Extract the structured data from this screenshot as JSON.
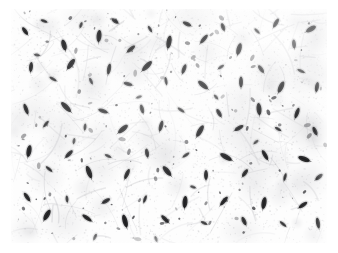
{
  "figure": {
    "kind": "histopathology-micrograph",
    "title": "",
    "caption": "",
    "scale_bar_label": "",
    "annotation_label": ""
  },
  "image": {
    "page_background": "#ffffff",
    "plate_left": 11,
    "plate_top": 9,
    "plate_width": 316,
    "plate_height": 234,
    "background_color": "#fdfdfd",
    "stroma_color": "#d8d8da",
    "stroma_color_dark": "#b4b4b8",
    "nucleus_color": "#1a1a1c",
    "nucleus_color_soft": "#4a4a4e",
    "staining": "hematoxylin-eosin-pale",
    "tissue_pattern": "wavy-collagen-fibers",
    "cell_shape": "spindle-nuclei"
  },
  "chart_data": {
    "type": "scatter",
    "title": "",
    "xlabel": "",
    "ylabel": "",
    "xlim": [
      0,
      316
    ],
    "ylim": [
      0,
      234
    ],
    "grid": false,
    "legend": "none",
    "note": "Positions, sizes and orientations of the dark spindle-shaped nuclei visible in the micrograph, in plate pixel coordinates.",
    "nuclei": [
      {
        "x": 14,
        "y": 22,
        "len": 9,
        "w": 4,
        "rot": 55,
        "shade": 0.86
      },
      {
        "x": 33,
        "y": 12,
        "len": 7,
        "w": 3,
        "rot": 20,
        "shade": 0.72
      },
      {
        "x": 53,
        "y": 36,
        "len": 11,
        "w": 5,
        "rot": 75,
        "shade": 0.92
      },
      {
        "x": 70,
        "y": 16,
        "len": 6,
        "w": 3,
        "rot": 110,
        "shade": 0.66
      },
      {
        "x": 88,
        "y": 27,
        "len": 12,
        "w": 5,
        "rot": 95,
        "shade": 0.9
      },
      {
        "x": 104,
        "y": 12,
        "len": 8,
        "w": 4,
        "rot": 35,
        "shade": 0.78
      },
      {
        "x": 120,
        "y": 40,
        "len": 10,
        "w": 4,
        "rot": 140,
        "shade": 0.84
      },
      {
        "x": 139,
        "y": 20,
        "len": 7,
        "w": 3,
        "rot": 60,
        "shade": 0.7
      },
      {
        "x": 158,
        "y": 33,
        "len": 13,
        "w": 5,
        "rot": 100,
        "shade": 0.93
      },
      {
        "x": 176,
        "y": 15,
        "len": 9,
        "w": 4,
        "rot": 25,
        "shade": 0.8
      },
      {
        "x": 193,
        "y": 30,
        "len": 11,
        "w": 4,
        "rot": 130,
        "shade": 0.88
      },
      {
        "x": 212,
        "y": 18,
        "len": 8,
        "w": 4,
        "rot": 70,
        "shade": 0.76
      },
      {
        "x": 228,
        "y": 40,
        "len": 12,
        "w": 5,
        "rot": 105,
        "shade": 0.91
      },
      {
        "x": 246,
        "y": 22,
        "len": 7,
        "w": 3,
        "rot": 45,
        "shade": 0.68
      },
      {
        "x": 265,
        "y": 14,
        "len": 10,
        "w": 4,
        "rot": 120,
        "shade": 0.86
      },
      {
        "x": 283,
        "y": 35,
        "len": 9,
        "w": 4,
        "rot": 85,
        "shade": 0.82
      },
      {
        "x": 300,
        "y": 20,
        "len": 11,
        "w": 5,
        "rot": 150,
        "shade": 0.89
      },
      {
        "x": 20,
        "y": 58,
        "len": 10,
        "w": 4,
        "rot": 95,
        "shade": 0.85
      },
      {
        "x": 42,
        "y": 70,
        "len": 8,
        "w": 3,
        "rot": 30,
        "shade": 0.74
      },
      {
        "x": 60,
        "y": 55,
        "len": 12,
        "w": 5,
        "rot": 125,
        "shade": 0.92
      },
      {
        "x": 80,
        "y": 72,
        "len": 7,
        "w": 3,
        "rot": 65,
        "shade": 0.7
      },
      {
        "x": 98,
        "y": 60,
        "len": 11,
        "w": 4,
        "rot": 100,
        "shade": 0.87
      },
      {
        "x": 117,
        "y": 75,
        "len": 9,
        "w": 4,
        "rot": 15,
        "shade": 0.79
      },
      {
        "x": 136,
        "y": 57,
        "len": 13,
        "w": 5,
        "rot": 135,
        "shade": 0.93
      },
      {
        "x": 155,
        "y": 72,
        "len": 8,
        "w": 3,
        "rot": 80,
        "shade": 0.75
      },
      {
        "x": 173,
        "y": 60,
        "len": 10,
        "w": 4,
        "rot": 110,
        "shade": 0.86
      },
      {
        "x": 192,
        "y": 76,
        "len": 12,
        "w": 5,
        "rot": 40,
        "shade": 0.9
      },
      {
        "x": 210,
        "y": 58,
        "len": 7,
        "w": 3,
        "rot": 145,
        "shade": 0.69
      },
      {
        "x": 230,
        "y": 73,
        "len": 11,
        "w": 4,
        "rot": 90,
        "shade": 0.88
      },
      {
        "x": 250,
        "y": 60,
        "len": 9,
        "w": 4,
        "rot": 55,
        "shade": 0.81
      },
      {
        "x": 270,
        "y": 78,
        "len": 12,
        "w": 5,
        "rot": 115,
        "shade": 0.91
      },
      {
        "x": 290,
        "y": 62,
        "len": 8,
        "w": 3,
        "rot": 25,
        "shade": 0.73
      },
      {
        "x": 306,
        "y": 78,
        "len": 10,
        "w": 4,
        "rot": 100,
        "shade": 0.85
      },
      {
        "x": 15,
        "y": 100,
        "len": 11,
        "w": 4,
        "rot": 70,
        "shade": 0.88
      },
      {
        "x": 35,
        "y": 115,
        "len": 8,
        "w": 3,
        "rot": 130,
        "shade": 0.75
      },
      {
        "x": 55,
        "y": 98,
        "len": 13,
        "w": 5,
        "rot": 45,
        "shade": 0.93
      },
      {
        "x": 74,
        "y": 118,
        "len": 7,
        "w": 3,
        "rot": 95,
        "shade": 0.68
      },
      {
        "x": 92,
        "y": 102,
        "len": 10,
        "w": 4,
        "rot": 20,
        "shade": 0.84
      },
      {
        "x": 112,
        "y": 120,
        "len": 12,
        "w": 5,
        "rot": 140,
        "shade": 0.9
      },
      {
        "x": 131,
        "y": 100,
        "len": 9,
        "w": 4,
        "rot": 75,
        "shade": 0.8
      },
      {
        "x": 150,
        "y": 117,
        "len": 11,
        "w": 4,
        "rot": 105,
        "shade": 0.87
      },
      {
        "x": 170,
        "y": 101,
        "len": 8,
        "w": 3,
        "rot": 35,
        "shade": 0.72
      },
      {
        "x": 189,
        "y": 122,
        "len": 13,
        "w": 5,
        "rot": 120,
        "shade": 0.92
      },
      {
        "x": 208,
        "y": 104,
        "len": 9,
        "w": 4,
        "rot": 60,
        "shade": 0.82
      },
      {
        "x": 228,
        "y": 119,
        "len": 10,
        "w": 4,
        "rot": 150,
        "shade": 0.86
      },
      {
        "x": 248,
        "y": 100,
        "len": 12,
        "w": 5,
        "rot": 85,
        "shade": 0.91
      },
      {
        "x": 267,
        "y": 120,
        "len": 7,
        "w": 3,
        "rot": 30,
        "shade": 0.7
      },
      {
        "x": 286,
        "y": 104,
        "len": 11,
        "w": 4,
        "rot": 110,
        "shade": 0.88
      },
      {
        "x": 304,
        "y": 122,
        "len": 9,
        "w": 4,
        "rot": 65,
        "shade": 0.79
      },
      {
        "x": 18,
        "y": 142,
        "len": 12,
        "w": 5,
        "rot": 100,
        "shade": 0.9
      },
      {
        "x": 38,
        "y": 160,
        "len": 8,
        "w": 3,
        "rot": 40,
        "shade": 0.74
      },
      {
        "x": 58,
        "y": 145,
        "len": 10,
        "w": 4,
        "rot": 135,
        "shade": 0.85
      },
      {
        "x": 78,
        "y": 163,
        "len": 13,
        "w": 5,
        "rot": 70,
        "shade": 0.93
      },
      {
        "x": 97,
        "y": 147,
        "len": 7,
        "w": 3,
        "rot": 25,
        "shade": 0.67
      },
      {
        "x": 116,
        "y": 165,
        "len": 11,
        "w": 4,
        "rot": 115,
        "shade": 0.87
      },
      {
        "x": 136,
        "y": 144,
        "len": 9,
        "w": 4,
        "rot": 80,
        "shade": 0.81
      },
      {
        "x": 156,
        "y": 162,
        "len": 12,
        "w": 5,
        "rot": 50,
        "shade": 0.9
      },
      {
        "x": 175,
        "y": 146,
        "len": 8,
        "w": 3,
        "rot": 145,
        "shade": 0.73
      },
      {
        "x": 195,
        "y": 166,
        "len": 10,
        "w": 4,
        "rot": 90,
        "shade": 0.86
      },
      {
        "x": 215,
        "y": 148,
        "len": 13,
        "w": 5,
        "rot": 30,
        "shade": 0.92
      },
      {
        "x": 234,
        "y": 164,
        "len": 9,
        "w": 4,
        "rot": 125,
        "shade": 0.8
      },
      {
        "x": 254,
        "y": 146,
        "len": 11,
        "w": 4,
        "rot": 60,
        "shade": 0.88
      },
      {
        "x": 274,
        "y": 168,
        "len": 8,
        "w": 3,
        "rot": 105,
        "shade": 0.72
      },
      {
        "x": 293,
        "y": 150,
        "len": 12,
        "w": 5,
        "rot": 20,
        "shade": 0.91
      },
      {
        "x": 308,
        "y": 168,
        "len": 9,
        "w": 4,
        "rot": 140,
        "shade": 0.83
      },
      {
        "x": 16,
        "y": 188,
        "len": 10,
        "w": 4,
        "rot": 55,
        "shade": 0.85
      },
      {
        "x": 36,
        "y": 206,
        "len": 12,
        "w": 5,
        "rot": 120,
        "shade": 0.9
      },
      {
        "x": 56,
        "y": 190,
        "len": 7,
        "w": 3,
        "rot": 85,
        "shade": 0.69
      },
      {
        "x": 76,
        "y": 209,
        "len": 11,
        "w": 4,
        "rot": 35,
        "shade": 0.87
      },
      {
        "x": 95,
        "y": 192,
        "len": 9,
        "w": 4,
        "rot": 150,
        "shade": 0.78
      },
      {
        "x": 114,
        "y": 212,
        "len": 13,
        "w": 5,
        "rot": 75,
        "shade": 0.93
      },
      {
        "x": 134,
        "y": 190,
        "len": 8,
        "w": 3,
        "rot": 110,
        "shade": 0.74
      },
      {
        "x": 154,
        "y": 210,
        "len": 10,
        "w": 4,
        "rot": 45,
        "shade": 0.84
      },
      {
        "x": 174,
        "y": 193,
        "len": 12,
        "w": 5,
        "rot": 95,
        "shade": 0.91
      },
      {
        "x": 193,
        "y": 214,
        "len": 7,
        "w": 3,
        "rot": 25,
        "shade": 0.68
      },
      {
        "x": 213,
        "y": 192,
        "len": 11,
        "w": 4,
        "rot": 130,
        "shade": 0.88
      },
      {
        "x": 233,
        "y": 212,
        "len": 9,
        "w": 4,
        "rot": 65,
        "shade": 0.8
      },
      {
        "x": 253,
        "y": 194,
        "len": 12,
        "w": 5,
        "rot": 100,
        "shade": 0.9
      },
      {
        "x": 272,
        "y": 215,
        "len": 8,
        "w": 3,
        "rot": 40,
        "shade": 0.72
      },
      {
        "x": 292,
        "y": 196,
        "len": 10,
        "w": 4,
        "rot": 145,
        "shade": 0.86
      },
      {
        "x": 307,
        "y": 214,
        "len": 11,
        "w": 4,
        "rot": 80,
        "shade": 0.87
      },
      {
        "x": 26,
        "y": 46,
        "len": 6,
        "w": 3,
        "rot": 10,
        "shade": 0.6
      },
      {
        "x": 128,
        "y": 88,
        "len": 6,
        "w": 3,
        "rot": 160,
        "shade": 0.58
      },
      {
        "x": 205,
        "y": 88,
        "len": 6,
        "w": 3,
        "rot": 50,
        "shade": 0.62
      },
      {
        "x": 63,
        "y": 132,
        "len": 6,
        "w": 3,
        "rot": 100,
        "shade": 0.59
      },
      {
        "x": 182,
        "y": 178,
        "len": 6,
        "w": 3,
        "rot": 20,
        "shade": 0.61
      },
      {
        "x": 245,
        "y": 133,
        "len": 6,
        "w": 3,
        "rot": 140,
        "shade": 0.57
      },
      {
        "x": 145,
        "y": 230,
        "len": 6,
        "w": 3,
        "rot": 70,
        "shade": 0.6
      },
      {
        "x": 84,
        "y": 228,
        "len": 7,
        "w": 3,
        "rot": 115,
        "shade": 0.63
      }
    ],
    "fiber_bundles": {
      "count": 220,
      "orientation": "wavy-random",
      "mean_length": 26,
      "color": "#c9c9cd",
      "opacity_range": [
        0.12,
        0.45
      ]
    }
  }
}
